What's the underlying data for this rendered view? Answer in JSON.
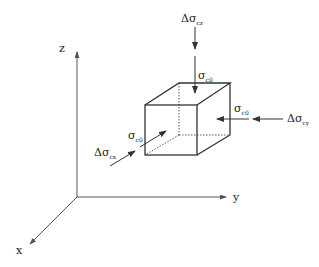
{
  "diagram": {
    "type": "stress-cube",
    "colors": {
      "line": "#333333",
      "axis": "#555555",
      "text": "#222222",
      "background": "#ffffff"
    },
    "axes": {
      "z": {
        "label": "z"
      },
      "y": {
        "label": "y"
      },
      "x": {
        "label": "x"
      }
    },
    "labels": {
      "top_delta": {
        "main": "Δσ",
        "sub": "cz"
      },
      "top_conf": {
        "main": "σ",
        "sub": "c0"
      },
      "right_conf": {
        "main": "σ",
        "sub": "c0"
      },
      "right_delta": {
        "main": "Δσ",
        "sub": "cy"
      },
      "left_conf": {
        "main": "σ",
        "sub": "c0"
      },
      "left_delta": {
        "main": "Δσ",
        "sub": "cx"
      }
    }
  }
}
